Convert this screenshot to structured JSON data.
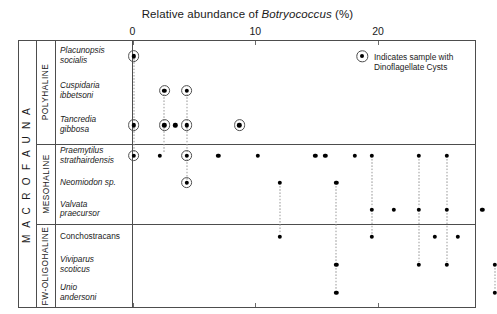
{
  "chart_data": {
    "type": "scatter",
    "title": "Relative abundance of Botryococcus (%)",
    "title_plain": "Relative abundance of ",
    "title_italic": "Botryococcus",
    "title_suffix": " (%)",
    "xlabel": "",
    "ylabel": "",
    "xlim": [
      -1,
      28
    ],
    "xticks": [
      0,
      10,
      20
    ],
    "xticklabels": [
      "0",
      "10",
      "20"
    ],
    "grid": false,
    "legend": {
      "position": "top-right",
      "marker": "circled-dot",
      "line1": "Indicates sample with",
      "line2": "Dinoflagellate Cysts"
    },
    "axis_group_label": "M A C R O F A U N A",
    "groups": [
      {
        "name": "POLYHALINE",
        "taxa": [
          {
            "name_line1": "Placunopsis",
            "name_line2": "socialis",
            "italic": true,
            "values": [
              0.1
            ],
            "cyst_flags": [
              true
            ]
          },
          {
            "name_line1": "Cuspidaria",
            "name_line2": "ibbetsoni",
            "italic": true,
            "values": [
              2.6,
              4.4
            ],
            "cyst_flags": [
              true,
              true
            ]
          },
          {
            "name_line1": "Tancredia",
            "name_line2": "gibbosa",
            "italic": true,
            "values": [
              0.1,
              2.6,
              3.5,
              4.4,
              8.7
            ],
            "cyst_flags": [
              true,
              true,
              false,
              true,
              true
            ]
          }
        ]
      },
      {
        "name": "MESOHALINE",
        "taxa": [
          {
            "name_line1": "Praemytilus",
            "name_line2": "strathairdensis",
            "italic": true,
            "values": [
              0.1,
              2.2,
              4.4,
              7.0,
              10.2,
              14.9,
              15.7,
              18.1,
              19.5,
              23.3,
              25.6
            ],
            "cyst_flags": [
              true,
              false,
              true,
              false,
              false,
              false,
              false,
              false,
              false,
              false,
              false
            ]
          },
          {
            "name_line1": "Neomiodon sp.",
            "name_line2": "",
            "italic": true,
            "values": [
              4.4,
              12.0,
              16.6
            ],
            "cyst_flags": [
              true,
              false,
              false
            ]
          },
          {
            "name_line1": "Valvata",
            "name_line2": "praecursor",
            "italic": true,
            "values": [
              19.5,
              21.3,
              23.3,
              25.6,
              28.5
            ],
            "cyst_flags": [
              false,
              false,
              false,
              false,
              false
            ]
          }
        ]
      },
      {
        "name": "FW-OLIGOHALINE",
        "taxa": [
          {
            "name_line1": "Conchostracans",
            "name_line2": "",
            "italic": false,
            "values": [
              12.0,
              19.5,
              24.6,
              26.5
            ],
            "cyst_flags": [
              false,
              false,
              false,
              false
            ]
          },
          {
            "name_line1": "Viviparus",
            "name_line2": "scoticus",
            "italic": true,
            "values": [
              16.6,
              23.3,
              25.6,
              29.5
            ],
            "cyst_flags": [
              false,
              false,
              false,
              false
            ]
          },
          {
            "name_line1": "Unio",
            "name_line2": "andersoni",
            "italic": true,
            "values": [
              16.6,
              29.5
            ],
            "cyst_flags": [
              false,
              false
            ]
          }
        ]
      }
    ]
  }
}
